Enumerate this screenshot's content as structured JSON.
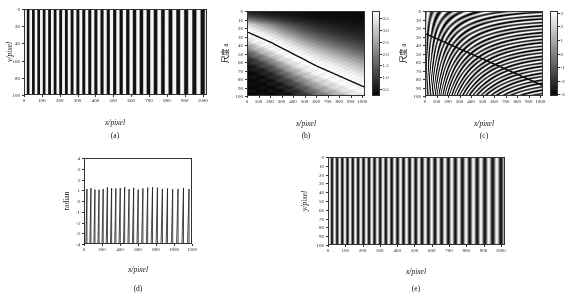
{
  "figure": {
    "panels": [
      "a",
      "b",
      "c",
      "d",
      "e"
    ]
  },
  "labels": {
    "x_pixel": "x/pixel",
    "y_pixel": "y/pixel",
    "scale_a": "尺度 a",
    "radian": "radian"
  },
  "captions": {
    "a": "(a)",
    "b": "(b)",
    "c": "(c)",
    "d": "(d)",
    "e": "(e)"
  },
  "chart_data": [
    {
      "id": "a",
      "type": "heatmap",
      "title": "Chirped fringe pattern (input interferogram)",
      "caption": "(a)",
      "xlabel": "x/pixel",
      "ylabel": "y/pixel",
      "xlim": [
        0,
        1024
      ],
      "ylim": [
        0,
        100
      ],
      "y_inverted": true,
      "grid": false,
      "xticks": [
        0,
        100,
        200,
        300,
        400,
        500,
        600,
        700,
        800,
        900,
        1000
      ],
      "yticks": [
        0,
        20,
        40,
        60,
        80,
        100
      ],
      "colormap": "gray",
      "pattern": "vertical fringes, frequency decreasing left to right (down-chirp)",
      "fringe_count": 40,
      "intensity_range": [
        0,
        255
      ]
    },
    {
      "id": "b",
      "type": "heatmap",
      "title": "Continuous wavelet transform modulus (scalogram)",
      "caption": "(b)",
      "xlabel": "x/pixel",
      "ylabel": "尺度 a",
      "xlim": [
        0,
        1024
      ],
      "ylim": [
        0,
        100
      ],
      "y_inverted": true,
      "grid": false,
      "xticks": [
        0,
        100,
        200,
        300,
        400,
        500,
        600,
        700,
        800,
        900,
        1000
      ],
      "yticks": [
        0,
        10,
        20,
        30,
        40,
        50,
        60,
        70,
        80,
        90,
        100
      ],
      "colormap": "gray",
      "colorbar": {
        "ticks": [
          0.5,
          1.0,
          1.5,
          2.0,
          2.5,
          3.0,
          3.5
        ],
        "tick_labels": [
          "0.5",
          "1.0",
          "1.5",
          "2.0",
          "2.5",
          "3.0",
          "3.5"
        ],
        "min": 0.2,
        "max": 3.8,
        "position": "right"
      },
      "ridge": {
        "name": "modulus maximum ridge",
        "x": [
          0,
          100,
          200,
          300,
          400,
          500,
          600,
          700,
          800,
          900,
          1000
        ],
        "a": [
          12,
          18,
          25,
          32,
          38,
          44,
          50,
          56,
          61,
          67,
          72
        ]
      }
    },
    {
      "id": "c",
      "type": "heatmap",
      "title": "Continuous wavelet transform phase",
      "caption": "(c)",
      "xlabel": "x/pixel",
      "ylabel": "尺度 a",
      "xlim": [
        0,
        1024
      ],
      "ylim": [
        0,
        100
      ],
      "y_inverted": true,
      "grid": false,
      "xticks": [
        0,
        100,
        200,
        300,
        400,
        500,
        600,
        700,
        800,
        900,
        1000
      ],
      "yticks": [
        0,
        10,
        20,
        30,
        40,
        50,
        60,
        70,
        80,
        90,
        100
      ],
      "colormap": "gray",
      "colorbar": {
        "ticks": [
          -3,
          -2,
          -1,
          0,
          1,
          2,
          3
        ],
        "tick_labels": [
          "-3",
          "-2",
          "-1",
          "0",
          "1",
          "2",
          "3"
        ],
        "min": -3.14159,
        "max": 3.14159,
        "position": "right"
      },
      "ridge": {
        "name": "phase ridge",
        "x": [
          0,
          100,
          200,
          300,
          400,
          500,
          600,
          700,
          800,
          900,
          1000
        ],
        "a": [
          13,
          19,
          25,
          31,
          37,
          43,
          49,
          55,
          60,
          66,
          71
        ]
      }
    },
    {
      "id": "d",
      "type": "line",
      "title": "Wrapped phase extracted along the ridge",
      "caption": "(d)",
      "xlabel": "x/pixel",
      "ylabel": "radian",
      "xlim": [
        0,
        1200
      ],
      "ylim": [
        -4,
        4
      ],
      "grid": false,
      "xticks": [
        0,
        200,
        400,
        600,
        800,
        1000,
        1200
      ],
      "yticks": [
        -4,
        -3,
        -2,
        -1,
        0,
        1,
        2,
        3,
        4
      ],
      "series": [
        {
          "name": "wrapped phase",
          "style": "sawtooth",
          "wrap_min": -3.14159,
          "wrap_max": 3.14159,
          "x_start": 0,
          "x_end": 1024,
          "cycles": 40,
          "description": "sawtooth wrapped phase, period increasing with x"
        }
      ]
    },
    {
      "id": "e",
      "type": "heatmap",
      "title": "Reconstructed fringe pattern",
      "caption": "(e)",
      "xlabel": "x/pixel",
      "ylabel": "y/pixel",
      "xlim": [
        0,
        1024
      ],
      "ylim": [
        0,
        100
      ],
      "y_inverted": true,
      "grid": false,
      "xticks": [
        0,
        100,
        200,
        300,
        400,
        500,
        600,
        700,
        800,
        900,
        1000
      ],
      "yticks": [
        0,
        10,
        20,
        30,
        40,
        50,
        60,
        70,
        80,
        90,
        100
      ],
      "colormap": "gray",
      "pattern": "vertical fringes, frequency decreasing left to right (down-chirp)",
      "fringe_count": 40,
      "intensity_range": [
        0,
        255
      ]
    }
  ]
}
